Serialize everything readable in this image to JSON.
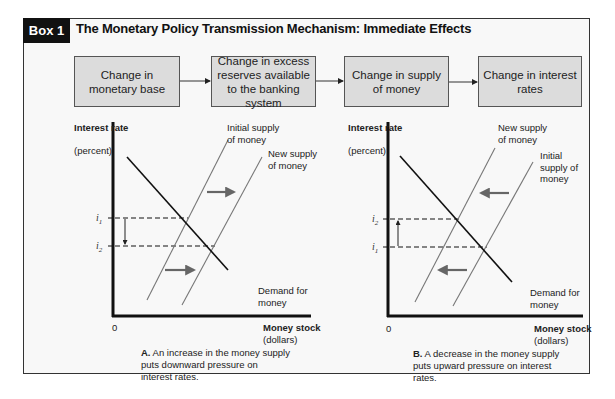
{
  "header": {
    "tag": "Box 1",
    "title": "The Monetary Policy Transmission Mechanism: Immediate Effects"
  },
  "flow": [
    {
      "label": "Change in monetary base"
    },
    {
      "label": "Change in excess reserves available to the banking system"
    },
    {
      "label": "Change in supply of money"
    },
    {
      "label": "Change in interest rates"
    }
  ],
  "panels": [
    {
      "id": "A",
      "y_label_bold": "Interest rate",
      "y_label_unit": "(percent)",
      "x_label_bold": "Money stock",
      "x_label_unit": "(dollars)",
      "origin": "0",
      "upper_rate": {
        "symbol": "i",
        "sub": "1"
      },
      "lower_rate": {
        "symbol": "i",
        "sub": "2"
      },
      "curve_labels": {
        "left_supply": "Initial supply of money",
        "right_supply": "New supply of money",
        "demand": "Demand for money"
      },
      "shift_direction": "right",
      "caption_prefix": "A.",
      "caption_text": " An increase in the money supply puts downward pressure on interest rates."
    },
    {
      "id": "B",
      "y_label_bold": "Interest rate",
      "y_label_unit": "(percent)",
      "x_label_bold": "Money stock",
      "x_label_unit": "(dollars)",
      "origin": "0",
      "upper_rate": {
        "symbol": "i",
        "sub": "2"
      },
      "lower_rate": {
        "symbol": "i",
        "sub": "1"
      },
      "curve_labels": {
        "left_supply": "New supply of money",
        "right_supply": "Initial supply of money",
        "demand": "Demand for money"
      },
      "shift_direction": "left",
      "caption_prefix": "B.",
      "caption_text": " A decrease in the money supply puts upward pressure on interest rates."
    }
  ],
  "colors": {
    "tag_bg": "#111111",
    "flow_box_bg": "#dcdcdc",
    "panel_bg": "#f8f8f8",
    "supply_line": "#777777",
    "demand_line": "#111111",
    "shift_arrow": "#666666"
  }
}
